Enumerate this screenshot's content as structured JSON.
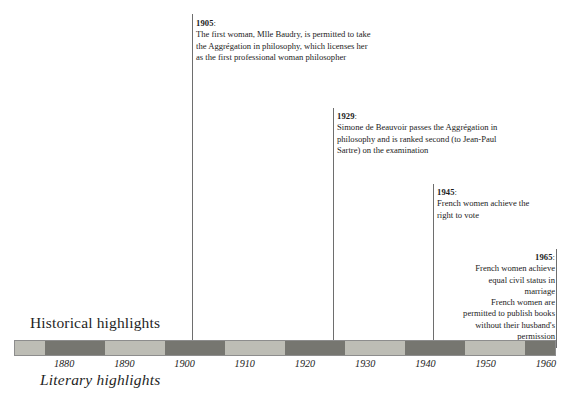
{
  "figure": {
    "width": 566,
    "height": 417,
    "background": "#ffffff"
  },
  "captions": {
    "historical": "Historical highlights",
    "literary": "Literary highlights"
  },
  "timeline": {
    "axis_start_year": 1875,
    "axis_end_year": 1965,
    "bar_left_px": 14,
    "bar_right_px": 556,
    "bar_top_px": 340,
    "bar_height_px": 16,
    "segment_light_color": "#bdbdb5",
    "segment_dark_color": "#767670",
    "border_color": "#8d8d8d",
    "ticks": [
      {
        "label": "1880",
        "year": 1880
      },
      {
        "label": "1890",
        "year": 1890
      },
      {
        "label": "1900",
        "year": 1900
      },
      {
        "label": "1910",
        "year": 1910
      },
      {
        "label": "1920",
        "year": 1920
      },
      {
        "label": "1930",
        "year": 1930
      },
      {
        "label": "1940",
        "year": 1940
      },
      {
        "label": "1950",
        "year": 1950
      },
      {
        "label": "1960",
        "year": 1960
      }
    ],
    "segments": [
      {
        "from": 1875,
        "to": 1880,
        "shade": "light"
      },
      {
        "from": 1880,
        "to": 1890,
        "shade": "dark"
      },
      {
        "from": 1890,
        "to": 1900,
        "shade": "light"
      },
      {
        "from": 1900,
        "to": 1910,
        "shade": "dark"
      },
      {
        "from": 1910,
        "to": 1920,
        "shade": "light"
      },
      {
        "from": 1920,
        "to": 1930,
        "shade": "dark"
      },
      {
        "from": 1930,
        "to": 1940,
        "shade": "light"
      },
      {
        "from": 1940,
        "to": 1950,
        "shade": "dark"
      },
      {
        "from": 1950,
        "to": 1960,
        "shade": "light"
      },
      {
        "from": 1960,
        "to": 1965,
        "shade": "dark"
      }
    ]
  },
  "events": [
    {
      "id": "event-1905",
      "year_label": "1905",
      "year_suffix": ":",
      "year": 1905,
      "align": "left",
      "leader_x": 192,
      "leader_top": 14,
      "leader_bottom": 348,
      "text_x": 196,
      "text_y": 18,
      "lines": [
        "The first woman, Mlle Baudry, is permitted to take",
        "the Aggrégation in philosophy, which licenses her",
        "as the first professional woman philosopher"
      ]
    },
    {
      "id": "event-1929",
      "year_label": "1929",
      "year_suffix": ":",
      "year": 1929,
      "align": "left",
      "leader_x": 333,
      "leader_top": 108,
      "leader_bottom": 348,
      "text_x": 337,
      "text_y": 111,
      "lines": [
        "Simone de Beauvoir passes the Aggrégation in",
        "philosophy and is ranked second (to Jean-Paul",
        "Sartre) on the examination"
      ]
    },
    {
      "id": "event-1945",
      "year_label": "1945",
      "year_suffix": ":",
      "year": 1945,
      "align": "left",
      "leader_x": 433,
      "leader_top": 184,
      "leader_bottom": 348,
      "text_x": 437,
      "text_y": 187,
      "lines": [
        "French women achieve the",
        "right to vote"
      ]
    },
    {
      "id": "event-1965",
      "year_label": "1965",
      "year_suffix": ":",
      "year": 1965,
      "align": "right",
      "leader_x": 556,
      "leader_top": 249,
      "leader_bottom": 348,
      "text_right": 555,
      "text_y": 252,
      "lines": [
        "French women achieve",
        "equal civil status in",
        "marriage",
        "French women are",
        "permitted to publish books",
        "without their husband's",
        "permission"
      ]
    }
  ]
}
